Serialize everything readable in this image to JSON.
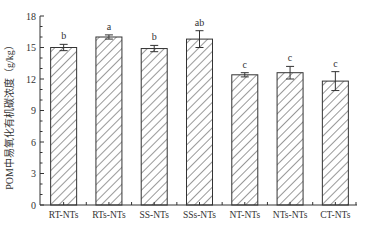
{
  "chart_data": {
    "type": "bar",
    "title": "",
    "xlabel": "",
    "ylabel": "POM中易氧化有机碳浓度（g/kg）",
    "ylim": [
      0,
      18
    ],
    "yticks": [
      0,
      3,
      6,
      9,
      12,
      15,
      18
    ],
    "grid": false,
    "legend": null,
    "pattern": "diagonal-hatch",
    "categories": [
      "RT-NTs",
      "RTs-NTs",
      "SS-NTs",
      "SSs-NTs",
      "NT-NTs",
      "NTs-NTs",
      "CT-NTs"
    ],
    "values": [
      15.0,
      16.0,
      14.9,
      15.8,
      12.4,
      12.6,
      11.8
    ],
    "errors": [
      0.3,
      0.2,
      0.3,
      0.8,
      0.2,
      0.6,
      0.9
    ],
    "significance": [
      "b",
      "a",
      "b",
      "ab",
      "c",
      "c",
      "c"
    ]
  },
  "axis": {
    "ytick_labels": [
      "0",
      "3",
      "6",
      "9",
      "12",
      "15",
      "18"
    ]
  }
}
